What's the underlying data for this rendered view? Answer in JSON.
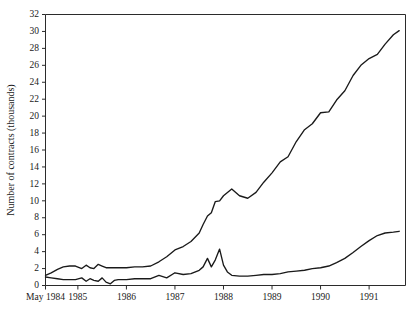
{
  "chart_data": {
    "type": "line",
    "title": "",
    "xlabel": "",
    "ylabel": "Number of contracts (thousands)",
    "xlim": [
      1984.333,
      1991.75
    ],
    "ylim": [
      0,
      32
    ],
    "grid": false,
    "legend": "none",
    "y_ticks": [
      0,
      2,
      4,
      6,
      8,
      10,
      12,
      14,
      16,
      18,
      20,
      22,
      24,
      26,
      28,
      30,
      32
    ],
    "y_tick_labels": [
      "0",
      "2",
      "4",
      "6",
      "8",
      "10",
      "12",
      "14",
      "16",
      "18",
      "20",
      "22",
      "24",
      "26",
      "28",
      "30",
      "32"
    ],
    "x_ticks": [
      1984.333,
      1985,
      1986,
      1987,
      1988,
      1989,
      1990,
      1991
    ],
    "x_tick_labels": [
      "May 1984",
      "1985",
      "1986",
      "1987",
      "1988",
      "1989",
      "1990",
      "1991"
    ],
    "series": [
      {
        "name": "upper",
        "color": "#1a1a1a",
        "x": [
          1984.333,
          1984.45,
          1984.58,
          1984.7,
          1984.83,
          1984.95,
          1985.08,
          1985.17,
          1985.25,
          1985.33,
          1985.42,
          1985.5,
          1985.58,
          1985.67,
          1985.75,
          1985.83,
          1985.92,
          1986.0,
          1986.17,
          1986.33,
          1986.5,
          1986.67,
          1986.83,
          1987.0,
          1987.17,
          1987.33,
          1987.5,
          1987.58,
          1987.67,
          1987.75,
          1987.83,
          1987.92,
          1988.0,
          1988.17,
          1988.33,
          1988.5,
          1988.67,
          1988.83,
          1989.0,
          1989.17,
          1989.33,
          1989.5,
          1989.67,
          1989.83,
          1990.0,
          1990.17,
          1990.33,
          1990.5,
          1990.67,
          1990.83,
          1991.0,
          1991.17,
          1991.33,
          1991.5,
          1991.62
        ],
        "y": [
          1.2,
          1.5,
          1.9,
          2.2,
          2.3,
          2.3,
          2.0,
          2.4,
          2.1,
          2.0,
          2.5,
          2.3,
          2.1,
          2.1,
          2.1,
          2.1,
          2.1,
          2.1,
          2.2,
          2.2,
          2.3,
          2.8,
          3.4,
          4.2,
          4.6,
          5.2,
          6.2,
          7.2,
          8.2,
          8.6,
          9.9,
          10.0,
          10.6,
          11.4,
          10.6,
          10.3,
          11.0,
          12.2,
          13.3,
          14.6,
          15.2,
          17.0,
          18.4,
          19.1,
          20.4,
          20.5,
          21.9,
          23.0,
          24.8,
          26.0,
          26.8,
          27.3,
          28.5,
          29.6,
          30.1
        ]
      },
      {
        "name": "lower",
        "color": "#1a1a1a",
        "x": [
          1984.333,
          1984.45,
          1984.58,
          1984.7,
          1984.83,
          1984.95,
          1985.08,
          1985.17,
          1985.25,
          1985.33,
          1985.42,
          1985.5,
          1985.58,
          1985.67,
          1985.75,
          1985.83,
          1985.92,
          1986.0,
          1986.17,
          1986.33,
          1986.5,
          1986.67,
          1986.83,
          1987.0,
          1987.17,
          1987.33,
          1987.5,
          1987.58,
          1987.67,
          1987.75,
          1987.83,
          1987.92,
          1988.0,
          1988.08,
          1988.17,
          1988.33,
          1988.5,
          1988.67,
          1988.83,
          1989.0,
          1989.17,
          1989.33,
          1989.5,
          1989.67,
          1989.83,
          1990.0,
          1990.17,
          1990.33,
          1990.5,
          1990.67,
          1990.83,
          1991.0,
          1991.17,
          1991.33,
          1991.5,
          1991.62
        ],
        "y": [
          1.0,
          0.9,
          0.8,
          0.7,
          0.7,
          0.7,
          0.9,
          0.5,
          0.8,
          0.6,
          0.5,
          0.9,
          0.4,
          0.2,
          0.6,
          0.7,
          0.7,
          0.7,
          0.8,
          0.8,
          0.8,
          1.2,
          0.9,
          1.5,
          1.3,
          1.4,
          1.8,
          2.2,
          3.2,
          2.2,
          3.0,
          4.3,
          2.4,
          1.6,
          1.2,
          1.1,
          1.1,
          1.2,
          1.3,
          1.3,
          1.4,
          1.6,
          1.7,
          1.8,
          2.0,
          2.1,
          2.3,
          2.7,
          3.2,
          3.9,
          4.6,
          5.3,
          5.9,
          6.2,
          6.3,
          6.4
        ]
      }
    ]
  }
}
